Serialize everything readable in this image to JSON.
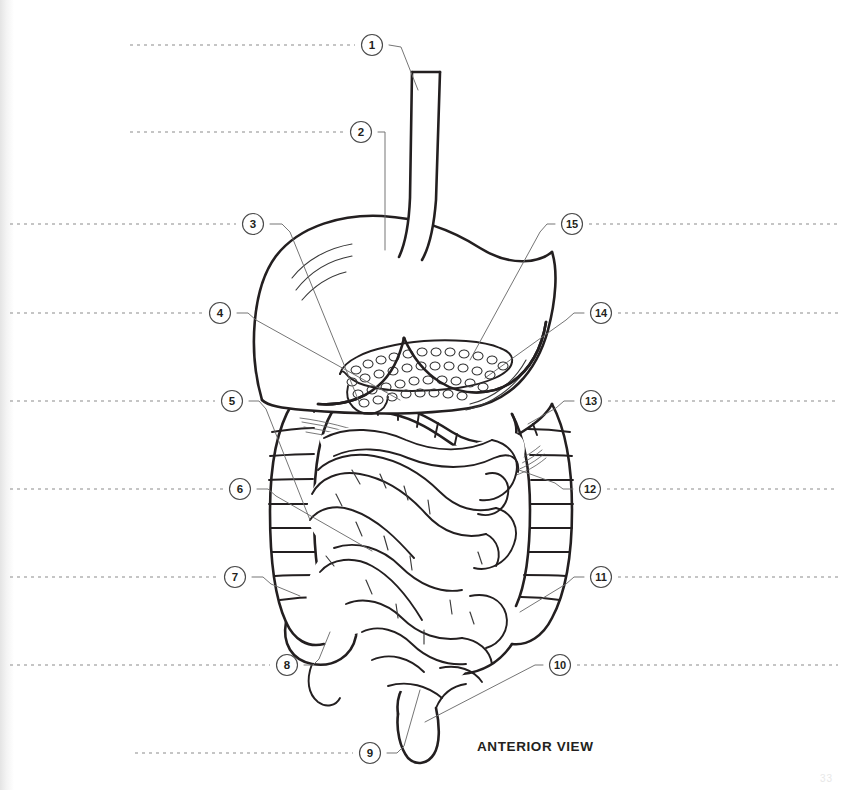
{
  "page": {
    "background_color": "#ffffff",
    "ink_color": "#231f20",
    "leader_color": "#6e6e6e",
    "dash_color": "#8c8c8c",
    "width": 845,
    "height": 790
  },
  "caption": {
    "text": "ANTERIOR VIEW",
    "x": 477,
    "y": 748
  },
  "folio": {
    "text": "33"
  },
  "markers": [
    {
      "id": "marker-1",
      "number": "1",
      "cx": 372,
      "cy": 45,
      "side": "left",
      "blank_from": 130,
      "blank_to": 355,
      "leader": "M 389,45 L 401,47 L 418,90"
    },
    {
      "id": "marker-2",
      "number": "2",
      "cx": 361,
      "cy": 132,
      "side": "left",
      "blank_from": 130,
      "blank_to": 344,
      "leader": "M 378,132 L 385,132 L 385,250"
    },
    {
      "id": "marker-3",
      "number": "3",
      "cx": 253,
      "cy": 224,
      "side": "left",
      "blank_from": 10,
      "blank_to": 236,
      "leader": "M 270,224 L 282,224 L 290,232 L 360,404"
    },
    {
      "id": "marker-4",
      "number": "4",
      "cx": 220,
      "cy": 313,
      "side": "left",
      "blank_from": 10,
      "blank_to": 203,
      "leader": "M 237,313 L 248,313 L 256,320 L 400,400"
    },
    {
      "id": "marker-5",
      "number": "5",
      "cx": 232,
      "cy": 401,
      "side": "left",
      "blank_from": 10,
      "blank_to": 215,
      "leader": "M 249,401 L 259,401 L 266,409 L 310,520"
    },
    {
      "id": "marker-6",
      "number": "6",
      "cx": 240,
      "cy": 489,
      "side": "left",
      "blank_from": 10,
      "blank_to": 223,
      "leader": "M 257,489 L 268,489 L 276,496 L 372,551"
    },
    {
      "id": "marker-7",
      "number": "7",
      "cx": 235,
      "cy": 577,
      "side": "left",
      "blank_from": 10,
      "blank_to": 218,
      "leader": "M 252,577 L 263,577 L 271,584 L 300,596"
    },
    {
      "id": "marker-8",
      "number": "8",
      "cx": 287,
      "cy": 665,
      "side": "left",
      "blank_from": 10,
      "blank_to": 270,
      "leader": "M 304,665 L 313,665 L 319,659 L 330,632"
    },
    {
      "id": "marker-9",
      "number": "9",
      "cx": 370,
      "cy": 753,
      "side": "left",
      "blank_from": 135,
      "blank_to": 353,
      "leader": "M 387,753 L 397,753 L 404,746 L 420,690"
    },
    {
      "id": "marker-10",
      "number": "10",
      "cx": 560,
      "cy": 665,
      "side": "right",
      "blank_from": 577,
      "blank_to": 838,
      "leader": "M 543,665 L 535,665 L 425,722"
    },
    {
      "id": "marker-11",
      "number": "11",
      "cx": 601,
      "cy": 577,
      "side": "right",
      "blank_from": 618,
      "blank_to": 838,
      "leader": "M 584,577 L 574,577 L 566,584 L 520,612"
    },
    {
      "id": "marker-12",
      "number": "12",
      "cx": 590,
      "cy": 489,
      "side": "right",
      "blank_from": 607,
      "blank_to": 838,
      "leader": "M 573,489 L 563,489 L 555,483 L 519,470"
    },
    {
      "id": "marker-13",
      "number": "13",
      "cx": 591,
      "cy": 401,
      "side": "right",
      "blank_from": 608,
      "blank_to": 838,
      "leader": "M 574,401 L 564,401 L 556,408 L 528,424"
    },
    {
      "id": "marker-14",
      "number": "14",
      "cx": 601,
      "cy": 313,
      "side": "right",
      "blank_from": 618,
      "blank_to": 838,
      "leader": "M 584,313 L 574,313 L 566,320 L 485,378"
    },
    {
      "id": "marker-15",
      "number": "15",
      "cx": 572,
      "cy": 224,
      "side": "right",
      "blank_from": 589,
      "blank_to": 838,
      "leader": "M 555,224 L 547,224 L 540,232 L 470,360"
    }
  ],
  "anatomy": {
    "esophagus": "esophagus-tube",
    "stomach": "stomach-body",
    "pancreas": "pancreas-gland",
    "transverse_colon": "transverse-colon",
    "ascending_colon": "ascending-colon",
    "descending_colon": "descending-colon",
    "cecum": "cecum",
    "appendix": "vermiform-appendix",
    "small_intestine": "small-intestine-coils",
    "rectum": "rectum",
    "sigmoid_colon": "sigmoid-colon"
  }
}
